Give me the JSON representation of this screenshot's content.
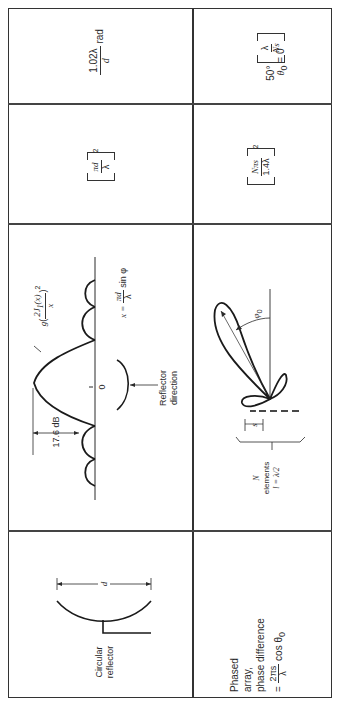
{
  "table": {
    "rows": [
      {
        "type": {
          "label": "Circular reflector",
          "label_lines": [
            "Circular",
            "reflector"
          ],
          "dimension_label": "d"
        },
        "pattern": {
          "function_label": "g(2J1(x)/x)^2",
          "g": "g",
          "num": "2J",
          "num_sub": "1",
          "num_arg": "(x)",
          "den": "x",
          "exp": "2",
          "sidelobe_label": "17.6 dB",
          "origin_label": "0",
          "axis_label_prefix": "x =",
          "axis_num": "πd",
          "axis_den": "λ",
          "axis_suffix": "sin φ",
          "reflector_direction_lines": [
            "Reflector",
            "direction"
          ]
        },
        "gain": {
          "num": "πd",
          "den": "λ",
          "exp": "2"
        },
        "beamwidth": {
          "num": "1.02λ",
          "den": "d",
          "unit": "rad"
        }
      },
      {
        "type": {
          "label_lines": [
            "Phased",
            "array,",
            "phase difference"
          ],
          "eq_prefix": "=",
          "eq_num": "2πs",
          "eq_den": "λ",
          "eq_suffix": "cos θ",
          "eq_suffix_sub": "0"
        },
        "pattern": {
          "angle_label": "φ",
          "angle_sub": "0",
          "spacing_label": "s",
          "elements_lines": [
            "N",
            "elements",
            "l = λ/2"
          ]
        },
        "gain": {
          "num": "Nπs",
          "den": "1.4λ",
          "exp": "2"
        },
        "beamwidth": {
          "prefix": "50°",
          "num": "λ",
          "den": "Ns",
          "condition": "θ",
          "condition_sub": "0",
          "condition_rest": "= 0"
        }
      }
    ]
  }
}
